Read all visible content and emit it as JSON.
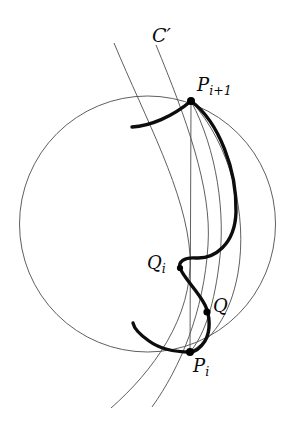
{
  "figure": {
    "width": 294,
    "height": 423,
    "background_color": "#ffffff",
    "thin_stroke_color": "#4d4d4d",
    "thick_stroke_color": "#0d0d0d",
    "point_color": "#000000",
    "labels": {
      "c_prime": "C",
      "c_prime_mark": "′",
      "p_next_base": "P",
      "p_next_sub": "i+1",
      "q_i_base": "Q",
      "q_i_sub": "i",
      "q": "Q",
      "p_i_base": "P",
      "p_i_sub": "i"
    },
    "points": [
      {
        "name": "P_{i+1}",
        "x": 191,
        "y": 101,
        "radius": 4.0
      },
      {
        "name": "Q_i",
        "x": 180,
        "y": 268,
        "radius": 3.1
      },
      {
        "name": "Q",
        "x": 207,
        "y": 312,
        "radius": 3.6
      },
      {
        "name": "P_i",
        "x": 190,
        "y": 352,
        "radius": 4.0
      }
    ],
    "circle": {
      "name": "boundary-circle",
      "center_x": 147.5,
      "center_y": 224,
      "radius": 128,
      "stroke_width": 0.9
    },
    "chord": {
      "name": "chord-Pi-Pi1",
      "x1": 191,
      "y1": 101,
      "x2": 190,
      "y2": 352,
      "stroke_width": 0.9
    }
  }
}
